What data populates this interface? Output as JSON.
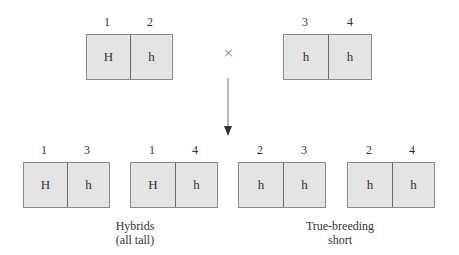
{
  "parents": [
    {
      "labels": [
        "1",
        "2"
      ],
      "alleles": [
        "H",
        "h"
      ]
    },
    {
      "labels": [
        "3",
        "4"
      ],
      "alleles": [
        "h",
        "h"
      ]
    }
  ],
  "cross_symbol": "×",
  "offspring": [
    {
      "labels": [
        "1",
        "3"
      ],
      "alleles": [
        "H",
        "h"
      ]
    },
    {
      "labels": [
        "1",
        "4"
      ],
      "alleles": [
        "H",
        "h"
      ]
    },
    {
      "labels": [
        "2",
        "3"
      ],
      "alleles": [
        "h",
        "h"
      ]
    },
    {
      "labels": [
        "2",
        "4"
      ],
      "alleles": [
        "h",
        "h"
      ]
    }
  ],
  "captions": {
    "hybrids_line1": "Hybrids",
    "hybrids_line2": "(all tall)",
    "short_line1": "True-breeding",
    "short_line2": "short"
  }
}
